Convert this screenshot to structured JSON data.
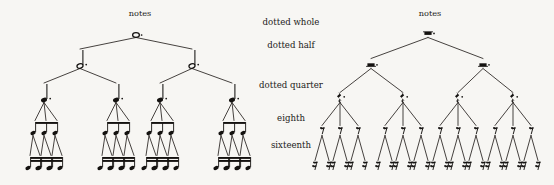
{
  "figure": {
    "background_color": "#f7f6f3",
    "ink_color": "#141210",
    "width": 554,
    "height": 185
  },
  "left_tree": {
    "title": "notes",
    "title_x": 140,
    "title_y": 16,
    "kind": "notes",
    "levels": [
      {
        "name": "dotted whole",
        "y": 35,
        "count": 1,
        "glyph": "dotted-whole-note",
        "x": [
          136
        ]
      },
      {
        "name": "dotted half",
        "y": 66,
        "count": 2,
        "glyph": "dotted-half-note",
        "x": [
          80,
          192
        ]
      },
      {
        "name": "dotted quarter",
        "y": 100,
        "count": 4,
        "glyph": "dotted-quarter-note",
        "x": [
          44,
          116,
          160,
          232
        ]
      },
      {
        "name": "eighth",
        "y": 133,
        "count": 12,
        "glyph": "beamed-eighth-note",
        "x": [
          33,
          44,
          55,
          105,
          116,
          127,
          149,
          160,
          171,
          221,
          232,
          243
        ]
      },
      {
        "name": "sixteenth",
        "y": 168,
        "count": 24,
        "glyph": "beamed-sixteenth-note",
        "x": [
          28,
          38,
          39,
          49,
          50,
          60,
          100,
          110,
          111,
          121,
          122,
          132,
          144,
          154,
          155,
          165,
          166,
          176,
          216,
          226,
          227,
          237,
          238,
          248
        ]
      }
    ]
  },
  "right_tree": {
    "title": "notes",
    "title_x": 430,
    "title_y": 16,
    "kind": "rests",
    "levels": [
      {
        "name": "dotted whole",
        "y": 35,
        "count": 1,
        "glyph": "dotted-whole-rest",
        "x": [
          428
        ]
      },
      {
        "name": "dotted half",
        "y": 66,
        "count": 2,
        "glyph": "dotted-half-rest",
        "x": [
          371,
          483
        ]
      },
      {
        "name": "dotted quarter",
        "y": 100,
        "count": 4,
        "glyph": "dotted-quarter-rest",
        "x": [
          340,
          403,
          458,
          513
        ]
      },
      {
        "name": "eighth",
        "y": 133,
        "count": 12,
        "glyph": "eighth-rest",
        "x": [
          322,
          340,
          358,
          385,
          403,
          421,
          440,
          458,
          476,
          495,
          513,
          531
        ]
      },
      {
        "name": "sixteenth",
        "y": 168,
        "count": 24,
        "glyph": "sixteenth-rest",
        "x": [
          315,
          329,
          333,
          347,
          351,
          365,
          378,
          392,
          396,
          410,
          414,
          428,
          433,
          447,
          451,
          465,
          469,
          483,
          488,
          502,
          506,
          520,
          524,
          538
        ]
      }
    ]
  },
  "row_labels": [
    {
      "text": "dotted whole",
      "x": 291,
      "y": 25
    },
    {
      "text": "dotted half",
      "x": 291,
      "y": 48
    },
    {
      "text": "dotted quarter",
      "x": 291,
      "y": 88
    },
    {
      "text": "eighth",
      "x": 291,
      "y": 121
    },
    {
      "text": "sixteenth",
      "x": 291,
      "y": 148
    }
  ],
  "structure": {
    "branching": [
      2,
      2,
      3,
      2
    ],
    "totals_per_level": [
      1,
      2,
      4,
      12,
      24
    ],
    "description": "Each dotted value subdivides: whole to two halves, half to two quarters, dotted quarter to three eighths, eighth to two sixteenths."
  }
}
